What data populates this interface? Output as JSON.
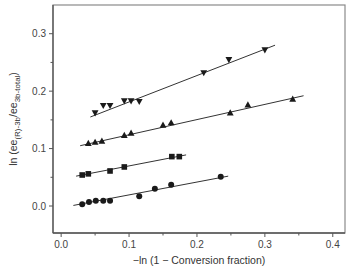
{
  "chart_data": {
    "type": "scatter",
    "title": "",
    "xlabel": "−ln (1 − Conversion fraction)",
    "ylabel": "ln (ee(R)-3b/ee3b-total)",
    "ylabel_parts": {
      "prefix": "ln (ee",
      "sub1": "(R)-3b",
      "mid": "/ee",
      "sub2": "3b-total",
      "suffix": ")"
    },
    "xlim": [
      -0.012,
      0.418
    ],
    "ylim": [
      -0.047,
      0.35
    ],
    "xticks": [
      0.0,
      0.1,
      0.2,
      0.3,
      0.4
    ],
    "xtick_labels": [
      "0.0",
      "0.1",
      "0.2",
      "0.3",
      "0.4"
    ],
    "xminor": [
      0.05,
      0.15,
      0.25,
      0.35
    ],
    "yticks": [
      0.0,
      0.1,
      0.2,
      0.3
    ],
    "ytick_labels": [
      "0.0",
      "0.1",
      "0.2",
      "0.3"
    ],
    "yminor": [
      0.05,
      0.15,
      0.25
    ],
    "grid": false,
    "legend": null,
    "series": [
      {
        "name": "circles",
        "marker": "circle",
        "x": [
          0.031,
          0.041,
          0.051,
          0.062,
          0.072,
          0.115,
          0.138,
          0.162,
          0.235
        ],
        "y": [
          0.003,
          0.007,
          0.009,
          0.009,
          0.009,
          0.017,
          0.03,
          0.037,
          0.051
        ],
        "fit": {
          "x": [
            0.018,
            0.246
          ],
          "y": [
            0.001,
            0.052
          ]
        }
      },
      {
        "name": "squares",
        "marker": "square",
        "x": [
          0.031,
          0.04,
          0.072,
          0.093,
          0.163,
          0.174
        ],
        "y": [
          0.054,
          0.056,
          0.061,
          0.068,
          0.086,
          0.086
        ],
        "fit": {
          "x": [
            0.022,
            0.184
          ],
          "y": [
            0.052,
            0.089
          ]
        }
      },
      {
        "name": "triangles-up",
        "marker": "triangle-up",
        "x": [
          0.04,
          0.05,
          0.06,
          0.093,
          0.103,
          0.15,
          0.162,
          0.249,
          0.275,
          0.341
        ],
        "y": [
          0.109,
          0.111,
          0.113,
          0.123,
          0.127,
          0.141,
          0.145,
          0.162,
          0.176,
          0.186
        ],
        "fit": {
          "x": [
            0.028,
            0.357
          ],
          "y": [
            0.105,
            0.192
          ]
        }
      },
      {
        "name": "triangles-down",
        "marker": "triangle-down",
        "x": [
          0.05,
          0.062,
          0.072,
          0.093,
          0.103,
          0.115,
          0.21,
          0.247,
          0.3
        ],
        "y": [
          0.162,
          0.175,
          0.175,
          0.183,
          0.183,
          0.182,
          0.232,
          0.255,
          0.272
        ],
        "fit": {
          "x": [
            0.043,
            0.315
          ],
          "y": [
            0.155,
            0.28
          ]
        }
      }
    ]
  },
  "colors": {
    "axis": "#555555",
    "data": "#1a1a1a",
    "frame": "#8a8a8a"
  }
}
